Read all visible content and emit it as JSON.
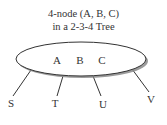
{
  "title": {
    "line1": "4-node (A, B, C)",
    "line2": "in a 2-3-4 Tree"
  },
  "node": {
    "keys": [
      "A",
      "B",
      "C"
    ],
    "fill": "#ffffff",
    "stroke": "#333333",
    "shadow": "#8a8a8a"
  },
  "children": [
    "S",
    "T",
    "U",
    "V"
  ]
}
